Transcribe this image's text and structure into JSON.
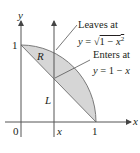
{
  "figure": {
    "axes": {
      "x_label": "x",
      "y_label": "y",
      "origin_label": "0",
      "x_tick_one": "1",
      "y_tick_one": "1",
      "x_position_label": "x"
    },
    "region_label": "R",
    "line_label": "L",
    "annotations": {
      "leaves": {
        "title": "Leaves at",
        "equation": "y = √(1 − x²)",
        "eq_prefix": "y = ",
        "eq_radicand": "1 − x",
        "eq_exp": "2"
      },
      "enters": {
        "title": "Enters at",
        "equation": "y = 1 − x"
      }
    },
    "colors": {
      "region_fill": "#d6d6d6",
      "axis": "#555555",
      "curve": "#7a7a7a",
      "text": "#231f20"
    }
  }
}
